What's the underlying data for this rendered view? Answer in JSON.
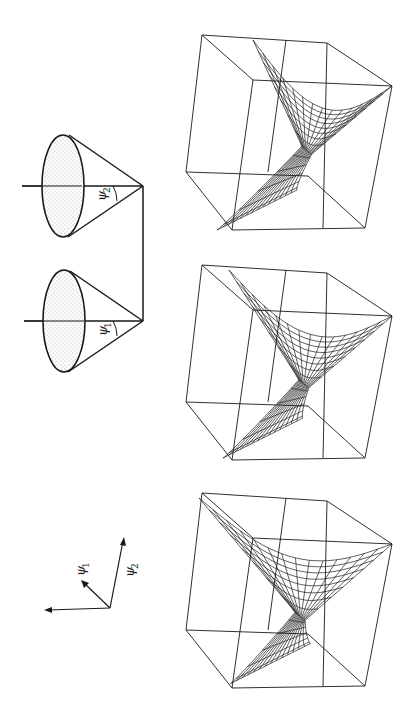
{
  "figure": {
    "ink_color": "#1a1a1a",
    "background": "#ffffff"
  },
  "cones": [
    {
      "name": "cone-psi2",
      "angle_symbol": "ψ",
      "angle_subscript": "2"
    },
    {
      "name": "cone-psi1",
      "angle_symbol": "ψ",
      "angle_subscript": "1"
    }
  ],
  "axes": {
    "labels": [
      {
        "symbol": "ψ",
        "subscript": "1"
      },
      {
        "symbol": "ψ",
        "subscript": "2"
      }
    ]
  },
  "panels": [
    {
      "name": "surface-plot-1",
      "twist": 1.0,
      "mesh_rows": 14,
      "mesh_cols": 14
    },
    {
      "name": "surface-plot-2",
      "twist": 0.8,
      "mesh_rows": 14,
      "mesh_cols": 14
    },
    {
      "name": "surface-plot-3",
      "twist": 0.55,
      "mesh_rows": 14,
      "mesh_cols": 14
    }
  ]
}
